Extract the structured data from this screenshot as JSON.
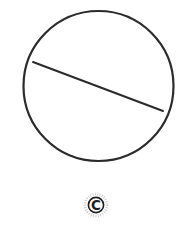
{
  "figure": {
    "background_color": "#ffffff",
    "width": 179,
    "height": 234
  },
  "diagram": {
    "type": "geometry-line-art",
    "stroke_color": "#2b2b2b",
    "circle": {
      "name": "circle-outline",
      "center_x": 98.5,
      "center_y": 86,
      "radius": 75,
      "stroke_width": 2.2
    },
    "chord": {
      "name": "chord-line",
      "x1": 33,
      "y1": 62,
      "x2": 163,
      "y2": 111,
      "stroke_width": 2.0
    }
  },
  "watermark": {
    "name": "copyright-emblem",
    "letter": "C",
    "center_x": 96,
    "center_y": 205,
    "outer_radius": 11,
    "inner_radius": 7.6,
    "letter_color": "#1f1f1f",
    "ring_color": "#9a9a9a",
    "halo_color": "#c9c9c9"
  }
}
